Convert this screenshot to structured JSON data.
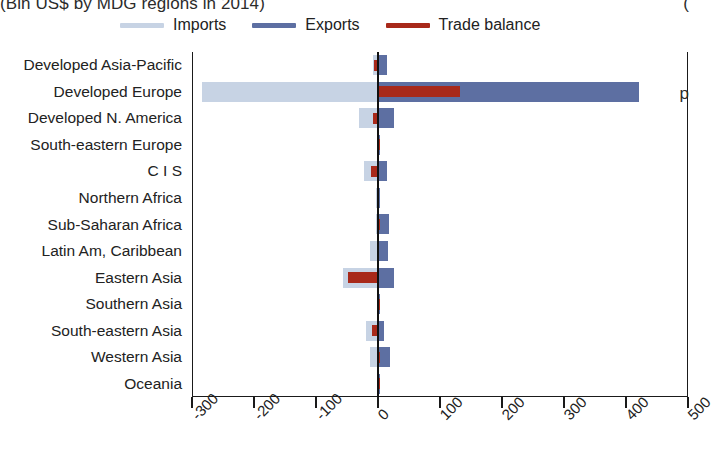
{
  "chart_data": {
    "type": "bar",
    "orientation": "horizontal",
    "title": "(Bln US$ by MDG regions in 2014)",
    "title_right_fragment": "(",
    "right_margin_fragment": "p",
    "xlabel": "",
    "ylabel": "",
    "xlim": [
      -300,
      500
    ],
    "xticks": [
      -300,
      -200,
      -100,
      0,
      100,
      200,
      300,
      400,
      500
    ],
    "xtick_labels": [
      "-300",
      "-200",
      "-100",
      "0",
      "100",
      "200",
      "300",
      "400",
      "500"
    ],
    "grid": false,
    "legend_position": "top",
    "categories": [
      "Developed Asia-Pacific",
      "Developed Europe",
      "Developed N. America",
      "South-eastern Europe",
      "C I S",
      "Northern Africa",
      "Sub-Saharan Africa",
      "Latin Am, Caribbean",
      "Eastern Asia",
      "Southern Asia",
      "South-eastern Asia",
      "Western Asia",
      "Oceania"
    ],
    "series": [
      {
        "name": "Imports",
        "color": "#c7d3e4",
        "note": "plotted on the negative side of zero",
        "values": [
          -8,
          -284,
          -30,
          -1,
          -22,
          -3,
          -4,
          -13,
          -56,
          -2,
          -20,
          -13,
          -1
        ]
      },
      {
        "name": "Exports",
        "color": "#5d6fa2",
        "values": [
          14,
          421,
          25,
          3,
          15,
          3,
          18,
          16,
          25,
          3,
          10,
          20,
          1
        ]
      },
      {
        "name": "Trade balance",
        "color": "#a8291a",
        "values": [
          -6,
          133,
          -8,
          1,
          -12,
          -1,
          1,
          -2,
          -48,
          0,
          -10,
          1,
          0
        ]
      }
    ]
  },
  "legend": {
    "items": [
      {
        "label": "Imports",
        "color": "#c7d3e4"
      },
      {
        "label": "Exports",
        "color": "#5d6fa2"
      },
      {
        "label": "Trade balance",
        "color": "#a8291a"
      }
    ]
  }
}
